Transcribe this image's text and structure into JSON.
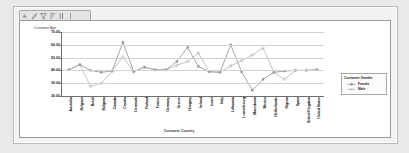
{
  "window": {
    "toolbar_icons": [
      {
        "name": "text-label-icon",
        "glyph": "A"
      },
      {
        "name": "edit-pencil-icon",
        "glyph": "pencil"
      },
      {
        "name": "filter-icon",
        "glyph": "filter"
      },
      {
        "name": "sort-icon",
        "glyph": "sort"
      },
      {
        "name": "column-icon",
        "glyph": "column"
      },
      {
        "name": "divider-icon",
        "glyph": "divider"
      }
    ]
  },
  "legend": {
    "title": "Customer Gender",
    "entries": [
      {
        "label": "Female",
        "color": "#8a8f9c"
      },
      {
        "label": "Male",
        "color": "#a9a9a9"
      }
    ]
  },
  "chart_data": {
    "type": "line",
    "title": "",
    "xlabel": "Customer Country",
    "ylabel": "Customer Age",
    "ylim": [
      20,
      70
    ],
    "yticks": [
      20,
      30,
      40,
      50,
      60,
      70
    ],
    "ytick_labels": [
      "20.00",
      "30.00",
      "40.00",
      "50.00",
      "60.00",
      "70.00"
    ],
    "grid": true,
    "legend_position": "right",
    "categories": [
      "Australia",
      "Belgium",
      "Brazil",
      "Bulgaria",
      "Canada",
      "Croatia",
      "Denmark",
      "Finland",
      "France",
      "Germany",
      "Greece",
      "Hungary",
      "Ireland",
      "Israel",
      "Italy",
      "Lithuania",
      "Luxembourg",
      "Macedonia",
      "Mexico",
      "Netherlands",
      "Nigeria",
      "Spain",
      "United Kingdom",
      "United States"
    ],
    "series": [
      {
        "name": "Female",
        "color": "#8a8f9c",
        "values": [
          40.5,
          44.5,
          40.0,
          38.5,
          39.5,
          62.0,
          39.0,
          42.5,
          40.5,
          40.5,
          47.0,
          58.0,
          43.0,
          39.0,
          38.5,
          60.0,
          39.0,
          24.5,
          33.0,
          38.5,
          39.5,
          40.0,
          40.0,
          40.5
        ]
      },
      {
        "name": "Male",
        "color": "#a9a9a9",
        "values": [
          40.5,
          44.5,
          27.5,
          30.0,
          39.5,
          50.5,
          39.0,
          42.5,
          40.5,
          40.5,
          44.0,
          47.0,
          53.5,
          39.0,
          38.5,
          43.5,
          47.5,
          52.0,
          57.5,
          38.5,
          33.0,
          40.0,
          40.0,
          40.5
        ]
      }
    ]
  }
}
